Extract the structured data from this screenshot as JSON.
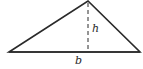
{
  "diagram": {
    "shape": "triangle",
    "vertices": {
      "left": [
        9,
        52
      ],
      "right": [
        140,
        52
      ],
      "apex": [
        88,
        1
      ]
    },
    "height_line": {
      "from": [
        88,
        2
      ],
      "to": [
        88,
        52
      ],
      "style": "dashed"
    },
    "labels": {
      "height": "h",
      "base": "b"
    },
    "colors": {
      "stroke": "#2a2a2a",
      "background": "#ffffff"
    }
  }
}
